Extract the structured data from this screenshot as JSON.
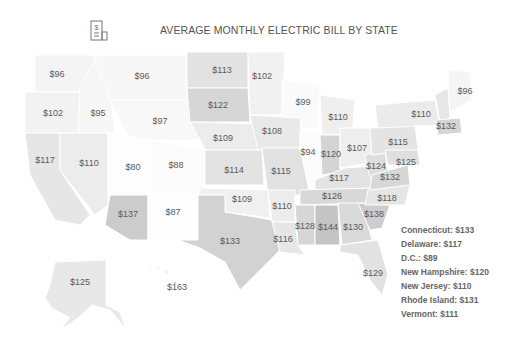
{
  "header": {
    "title": "AVERAGE MONTHLY ELECTRIC BILL BY STATE",
    "icon": "electric-bill-icon"
  },
  "colors": {
    "lightest": "#fbfbfb",
    "light": "#eeeeee",
    "mid": "#e0e0e0",
    "dark": "#cfcfcf",
    "darkest": "#bdbdbd",
    "label": "#5a5a5a",
    "title": "#555555"
  },
  "map": {
    "states": [
      {
        "id": "WA",
        "value": "$96",
        "x": 57,
        "y": 74
      },
      {
        "id": "MT",
        "value": "$96",
        "x": 142,
        "y": 76
      },
      {
        "id": "ND",
        "value": "$113",
        "x": 222,
        "y": 70
      },
      {
        "id": "MN",
        "value": "$102",
        "x": 262,
        "y": 76
      },
      {
        "id": "OR",
        "value": "$102",
        "x": 53,
        "y": 113
      },
      {
        "id": "ID",
        "value": "$95",
        "x": 98,
        "y": 113
      },
      {
        "id": "WY",
        "value": "$97",
        "x": 160,
        "y": 121
      },
      {
        "id": "SD",
        "value": "$122",
        "x": 218,
        "y": 105
      },
      {
        "id": "WI",
        "value": "$99",
        "x": 303,
        "y": 102
      },
      {
        "id": "MI",
        "value": "$110",
        "x": 338,
        "y": 117
      },
      {
        "id": "NY",
        "value": "$110",
        "x": 421,
        "y": 114
      },
      {
        "id": "ME",
        "value": "$96",
        "x": 465,
        "y": 91
      },
      {
        "id": "MA",
        "value": "$132",
        "x": 446,
        "y": 126
      },
      {
        "id": "NE",
        "value": "$109",
        "x": 223,
        "y": 138
      },
      {
        "id": "IA",
        "value": "$108",
        "x": 272,
        "y": 131
      },
      {
        "id": "CA",
        "value": "$117",
        "x": 45,
        "y": 160
      },
      {
        "id": "NV",
        "value": "$110",
        "x": 89,
        "y": 163
      },
      {
        "id": "UT",
        "value": "$80",
        "x": 133,
        "y": 167
      },
      {
        "id": "CO",
        "value": "$88",
        "x": 176,
        "y": 165
      },
      {
        "id": "KS",
        "value": "$114",
        "x": 234,
        "y": 170
      },
      {
        "id": "IL",
        "value": "$94",
        "x": 308,
        "y": 152
      },
      {
        "id": "IN",
        "value": "$120",
        "x": 331,
        "y": 154
      },
      {
        "id": "OH",
        "value": "$107",
        "x": 357,
        "y": 148
      },
      {
        "id": "PA",
        "value": "$115",
        "x": 398,
        "y": 142
      },
      {
        "id": "MO",
        "value": "$115",
        "x": 281,
        "y": 171
      },
      {
        "id": "WV",
        "value": "$124",
        "x": 376,
        "y": 166
      },
      {
        "id": "MD",
        "value": "$125",
        "x": 406,
        "y": 162
      },
      {
        "id": "KY",
        "value": "$117",
        "x": 339,
        "y": 178
      },
      {
        "id": "VA",
        "value": "$132",
        "x": 390,
        "y": 177
      },
      {
        "id": "AZ",
        "value": "$137",
        "x": 128,
        "y": 214
      },
      {
        "id": "NM",
        "value": "$87",
        "x": 173,
        "y": 212
      },
      {
        "id": "OK",
        "value": "$109",
        "x": 242,
        "y": 199
      },
      {
        "id": "AR",
        "value": "$110",
        "x": 282,
        "y": 206
      },
      {
        "id": "TN",
        "value": "$126",
        "x": 332,
        "y": 196
      },
      {
        "id": "NC",
        "value": "$118",
        "x": 387,
        "y": 198
      },
      {
        "id": "SC",
        "value": "$138",
        "x": 374,
        "y": 214
      },
      {
        "id": "TX",
        "value": "$133",
        "x": 230,
        "y": 241
      },
      {
        "id": "LA",
        "value": "$116",
        "x": 283,
        "y": 239
      },
      {
        "id": "MS",
        "value": "$128",
        "x": 305,
        "y": 226
      },
      {
        "id": "AL",
        "value": "$144",
        "x": 328,
        "y": 227
      },
      {
        "id": "GA",
        "value": "$130",
        "x": 353,
        "y": 227
      },
      {
        "id": "FL",
        "value": "$129",
        "x": 373,
        "y": 273
      },
      {
        "id": "AK",
        "value": "$125",
        "x": 80,
        "y": 282
      },
      {
        "id": "HI",
        "value": "$163",
        "x": 177,
        "y": 287
      }
    ]
  },
  "legend": {
    "items": [
      "Connecticut: $133",
      "Delaware: $117",
      "D.C.: $89",
      "New Hampshire: $120",
      "New Jersey: $110",
      "Rhode Island: $131",
      "Vermont: $111"
    ]
  }
}
